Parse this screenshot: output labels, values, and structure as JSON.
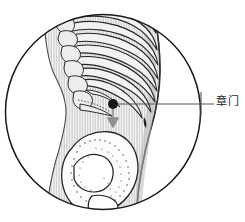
{
  "figure": {
    "type": "anatomical-acupoint-illustration",
    "view": "circular-magnified-inset",
    "background_color": "#ffffff",
    "circle": {
      "name": "magnifier-circle",
      "center_x": 103,
      "center_y": 112,
      "radius": 98,
      "stroke_color": "#1a1a1a",
      "fill_color": "#ffffff"
    },
    "body": {
      "name": "torso-silhouette",
      "fill_color": "#cfcfcf",
      "hatch_color": "#ffffff",
      "outline_color": "#3a3a3a"
    },
    "skeleton": {
      "ribs_count": 8,
      "rib_fill": "#f2f2f2",
      "rib_stroke": "#2b2b2b",
      "vertebrae_count": 7,
      "vertebra_fill": "#ededed",
      "vertebra_stroke": "#2b2b2b",
      "pelvis_fill": "#fbfbfb",
      "pelvis_stroke": "#2b2b2b",
      "pelvis_stipple_color": "#3a3a3a"
    },
    "acupoint": {
      "name": "Zhangmen",
      "label": "章门",
      "marker_color": "#171717",
      "marker_x": 113,
      "marker_y": 104,
      "marker_radius": 5,
      "arrow_color": "#8f8f8f",
      "arrow_direction": "down",
      "arrow_length": 20
    },
    "leader_line": {
      "name": "callout-leader-line",
      "color": "#555555",
      "start_x": 113,
      "start_y": 104,
      "end_x": 214,
      "end_y": 104,
      "tick_x": 201,
      "tick_top_y": 92,
      "tick_bottom_y": 116
    }
  }
}
